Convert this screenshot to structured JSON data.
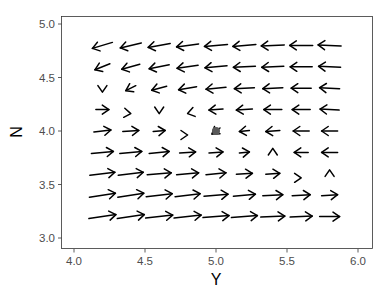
{
  "chart_data": {
    "type": "quiver",
    "title": "",
    "xlabel": "Y",
    "ylabel": "N",
    "xlim": [
      3.94,
      6.04
    ],
    "ylim": [
      2.93,
      5.08
    ],
    "grid": false,
    "legend": null,
    "x_ticks": [
      "4.0",
      "4.5",
      "5.0",
      "5.5",
      "6.0"
    ],
    "y_ticks": [
      "3.0",
      "3.5",
      "4.0",
      "4.5",
      "5.0"
    ],
    "x_tick_values": [
      4.0,
      4.5,
      5.0,
      5.5,
      6.0
    ],
    "y_tick_values": [
      3.0,
      3.5,
      4.0,
      4.5,
      5.0
    ],
    "equilibrium_point": {
      "x": 5.0,
      "y": 4.0,
      "color": "#595959"
    },
    "grid_x": [
      4.2,
      4.4,
      4.6,
      4.8,
      5.0,
      5.2,
      5.4,
      5.6,
      5.8
    ],
    "grid_y": [
      4.8,
      4.6,
      4.4,
      4.2,
      4.0,
      3.8,
      3.6,
      3.4,
      3.2
    ],
    "arrows_px_note": "dx, dy in pixels per grid cell (rows top to bottom, cols left to right); positive dy = downward on screen",
    "vectors": [
      [
        [
          -20,
          6
        ],
        [
          -21,
          5
        ],
        [
          -22,
          4
        ],
        [
          -22,
          3
        ],
        [
          -23,
          2
        ],
        [
          -23,
          2
        ],
        [
          -23,
          1
        ],
        [
          -23,
          0
        ],
        [
          -23,
          -1
        ]
      ],
      [
        [
          -15,
          6
        ],
        [
          -18,
          5
        ],
        [
          -20,
          4
        ],
        [
          -21,
          3
        ],
        [
          -22,
          2
        ],
        [
          -22,
          1
        ],
        [
          -22,
          1
        ],
        [
          -22,
          0
        ],
        [
          -22,
          -1
        ]
      ],
      [
        [
          0,
          9
        ],
        [
          -10,
          5
        ],
        [
          -15,
          4
        ],
        [
          -18,
          3
        ],
        [
          -20,
          2
        ],
        [
          -20,
          1
        ],
        [
          -20,
          1
        ],
        [
          -20,
          0
        ],
        [
          -20,
          -1
        ]
      ],
      [
        [
          13,
          0
        ],
        [
          8,
          1
        ],
        [
          0,
          9
        ],
        [
          -8,
          2
        ],
        [
          -14,
          1
        ],
        [
          -16,
          1
        ],
        [
          -18,
          0
        ],
        [
          -18,
          0
        ],
        [
          -19,
          -1
        ]
      ],
      [
        [
          17,
          -2
        ],
        [
          16,
          -1
        ],
        [
          12,
          -1
        ],
        [
          8,
          0
        ],
        [
          -8,
          6
        ],
        [
          -10,
          1
        ],
        [
          -14,
          1
        ],
        [
          -16,
          0
        ],
        [
          -16,
          0
        ]
      ],
      [
        [
          22,
          -2
        ],
        [
          22,
          -2
        ],
        [
          20,
          -2
        ],
        [
          16,
          -1
        ],
        [
          14,
          -1
        ],
        [
          10,
          -1
        ],
        [
          0,
          -9
        ],
        [
          -14,
          0
        ],
        [
          -16,
          0
        ]
      ],
      [
        [
          25,
          -3
        ],
        [
          25,
          -3
        ],
        [
          24,
          -2
        ],
        [
          22,
          -2
        ],
        [
          20,
          -2
        ],
        [
          16,
          -1
        ],
        [
          14,
          -1
        ],
        [
          8,
          0
        ],
        [
          0,
          -9
        ]
      ],
      [
        [
          26,
          -4
        ],
        [
          26,
          -4
        ],
        [
          26,
          -3
        ],
        [
          25,
          -3
        ],
        [
          24,
          -2
        ],
        [
          22,
          -2
        ],
        [
          20,
          -1
        ],
        [
          18,
          -1
        ],
        [
          16,
          -1
        ]
      ],
      [
        [
          27,
          -4
        ],
        [
          27,
          -4
        ],
        [
          27,
          -3
        ],
        [
          27,
          -3
        ],
        [
          26,
          -2
        ],
        [
          26,
          -2
        ],
        [
          24,
          -1
        ],
        [
          22,
          -1
        ],
        [
          20,
          0
        ]
      ]
    ],
    "arrow_color": "#000000"
  }
}
